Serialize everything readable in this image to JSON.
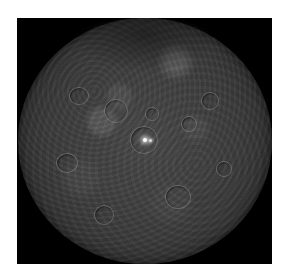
{
  "image": {
    "subject": "Ceres dwarf planet",
    "description": "Grayscale view of a cratered, heavily textured spherical body against a black background, with a small bright spot near the center",
    "background_color": "#000000",
    "border_color": "#ffffff",
    "surface_color": "#404040",
    "bright_spot_color": "#ffffff"
  }
}
